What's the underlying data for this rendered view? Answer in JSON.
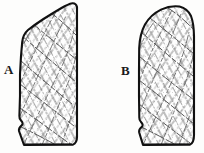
{
  "figure": {
    "type": "line-drawing",
    "background_color": "#fdfdfc",
    "outline_color": "#111111",
    "hatch_color": "#5a5a5a",
    "width": 204,
    "height": 153
  },
  "labels": {
    "a": "A",
    "b": "B"
  },
  "specimens": [
    {
      "id": "specimen-a",
      "label": "A",
      "outline_path": "M 24 145 L 19 130 L 22 124 L 19 118 L 20 96 L 20 74 L 21 56 L 22 42 L 25 34 L 32 27 L 41 21 L 50 15 L 58 9 L 65 5 L 71 3 L 75 4 L 77 8 L 77 24 L 77 48 L 77 72 L 77 96 L 77 120 L 77 136 L 76 142 L 72 145 Z",
      "outline_width": 2.1,
      "hatch_angle_primary": 58,
      "hatch_angle_secondary": -52,
      "notch": "bottom-left wavy step"
    },
    {
      "id": "specimen-b",
      "label": "B",
      "outline_path": "M 143 145 L 139 132 L 142 126 L 139 120 L 139 96 L 139 70 L 139 48 L 141 34 L 146 23 L 154 14 L 164 8 L 175 6 L 184 9 L 190 16 L 193 26 L 194 40 L 194 62 L 194 88 L 194 114 L 194 134 L 193 142 L 189 145 Z",
      "outline_width": 2.1,
      "hatch_angle_primary": 62,
      "hatch_angle_secondary": -55,
      "notch": "bottom-left wavy step"
    }
  ]
}
